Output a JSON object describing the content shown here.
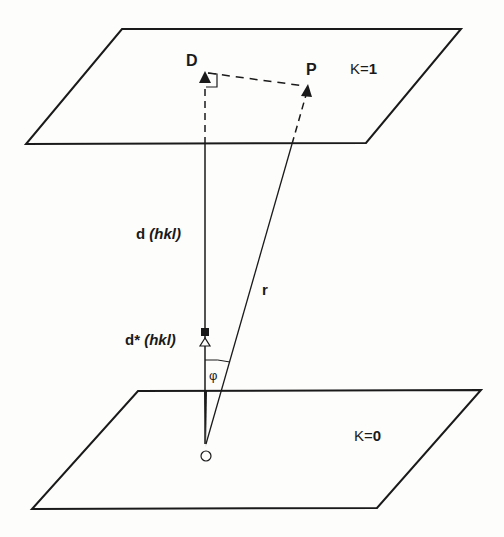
{
  "labels": {
    "D": "D",
    "P": "P",
    "plane_top": {
      "var": "K",
      "eq": "=",
      "val": "1"
    },
    "plane_bottom": {
      "var": "K",
      "eq": "=",
      "val": "0"
    },
    "d_main": "d",
    "d_hkl": "(hkl)",
    "dstar_main": "d*",
    "dstar_hkl": "(hkl)",
    "r": "r",
    "phi": "φ",
    "origin": "O"
  },
  "colors": {
    "line": "#1a1a1a",
    "background": "#fdfdfc"
  },
  "geometry": {
    "plane_top": [
      [
        122,
        29
      ],
      [
        461,
        29
      ],
      [
        366,
        143
      ],
      [
        26,
        144
      ]
    ],
    "plane_bottom": [
      [
        138,
        391
      ],
      [
        481,
        390
      ],
      [
        377,
        508
      ],
      [
        32,
        509
      ]
    ],
    "origin": [
      206,
      445
    ],
    "D": [
      204,
      76
    ],
    "P": [
      308,
      88
    ],
    "dstar_marker": [
      205,
      332
    ]
  }
}
